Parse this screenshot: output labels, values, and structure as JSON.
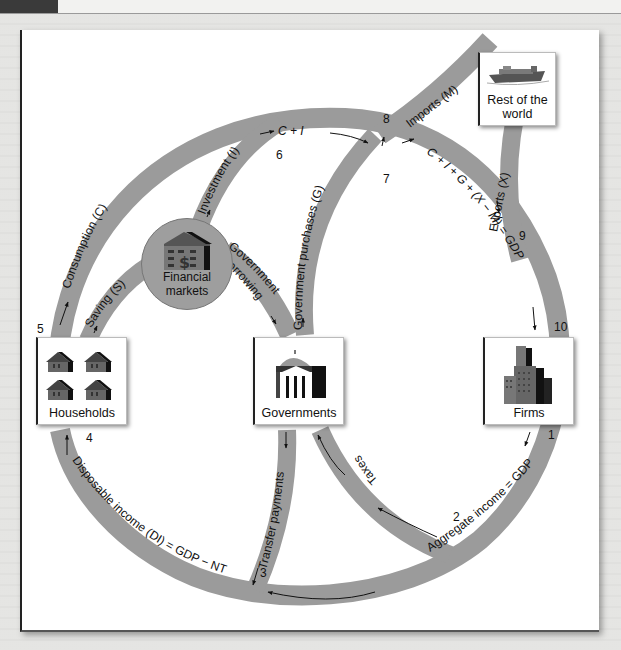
{
  "diagram": {
    "type": "circular-flow",
    "colors": {
      "flow_band": "#9b9b9b",
      "node_border": "#bbbbbb",
      "background": "#ffffff"
    },
    "nodes": {
      "households": {
        "label": "Households",
        "icon": "houses-icon"
      },
      "financial_markets": {
        "label_line1": "Financial",
        "label_line2": "markets",
        "icon": "bank-building-dollar-icon"
      },
      "governments": {
        "label": "Governments",
        "icon": "capitol-building-icon"
      },
      "firms": {
        "label": "Firms",
        "icon": "office-towers-icon"
      },
      "rest_of_world": {
        "label_line1": "Rest of the",
        "label_line2": "world",
        "icon": "cargo-ship-icon"
      }
    },
    "flows": {
      "consumption": "Consumption (C)",
      "saving": "Saving (S)",
      "investment": "Investment (I)",
      "c_plus_i": "C + I",
      "government_borrowing_1": "Government",
      "government_borrowing_2": "borrowing",
      "government_purchases": "Government purchases (G)",
      "imports": "Imports (M)",
      "exports": "Exports (X)",
      "gdp_identity": "C + I + G + (X − M) = GDP",
      "aggregate_income": "Aggregate income = GDP",
      "taxes": "Taxes",
      "transfer_payments": "Transfer payments",
      "disposable_income": "Disposable income (DI) = GDP − NT"
    },
    "step_numbers": {
      "n1": "1",
      "n2": "2",
      "n3": "3",
      "n4": "4",
      "n5": "5",
      "n6": "6",
      "n7": "7",
      "n8": "8",
      "n9": "9",
      "n10": "10"
    }
  }
}
